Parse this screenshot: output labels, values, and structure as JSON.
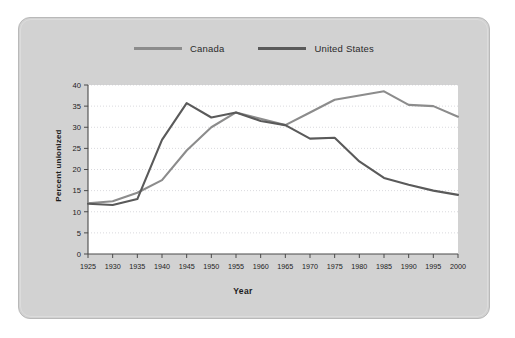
{
  "figure": {
    "panel_bg": "#d2d2d2",
    "plot_bg": "#ffffff"
  },
  "legend": {
    "position": "top-center",
    "items": [
      {
        "label": "Canada",
        "color": "#8c8c8c"
      },
      {
        "label": "United States",
        "color": "#5a5a5a"
      }
    ]
  },
  "chart_data": {
    "type": "line",
    "title": "",
    "xlabel": "Year",
    "ylabel": "Percent unionized",
    "xlim": [
      1925,
      2000
    ],
    "ylim": [
      0,
      40
    ],
    "ytick_step": 5,
    "xtick_step": 5,
    "grid": "horizontal-dotted",
    "yticks": [
      0,
      5,
      10,
      15,
      20,
      25,
      30,
      35,
      40
    ],
    "xticks": [
      1925,
      1930,
      1935,
      1940,
      1945,
      1950,
      1955,
      1960,
      1965,
      1970,
      1975,
      1980,
      1985,
      1990,
      1995,
      2000
    ],
    "x": [
      1925,
      1930,
      1935,
      1940,
      1945,
      1950,
      1955,
      1960,
      1965,
      1970,
      1975,
      1980,
      1985,
      1990,
      1995,
      2000
    ],
    "series": [
      {
        "name": "Canada",
        "color": "#8c8c8c",
        "values": [
          12.0,
          12.5,
          14.5,
          17.5,
          24.5,
          30.0,
          33.5,
          32.0,
          30.5,
          33.5,
          36.5,
          37.5,
          38.5,
          35.3,
          35.0,
          32.5
        ]
      },
      {
        "name": "United States",
        "color": "#5a5a5a",
        "values": [
          11.9,
          11.6,
          13.0,
          27.0,
          35.7,
          32.3,
          33.5,
          31.5,
          30.5,
          27.3,
          27.5,
          21.9,
          18.0,
          16.4,
          15.0,
          14.0
        ]
      }
    ]
  }
}
